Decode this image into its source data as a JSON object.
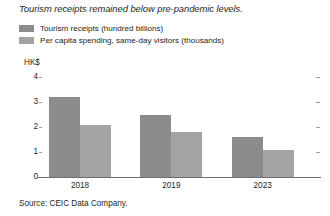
{
  "chart_data": {
    "type": "bar",
    "title": "Tourism receipts remained below pre-pandemic levels.",
    "xlabel": "",
    "ylabel": "HK$",
    "categories": [
      "2018",
      "2019",
      "2023"
    ],
    "series": [
      {
        "name": "Tourism receipts (hundred billions)",
        "color": "#8b8b8b",
        "values": [
          3.2,
          2.5,
          1.6
        ]
      },
      {
        "name": "Per capita spending, same-day visitors (thousands)",
        "color": "#a3a3a3",
        "values": [
          2.1,
          1.8,
          1.1
        ]
      }
    ],
    "ylim": [
      0,
      4
    ],
    "yticks": [
      0,
      1,
      2,
      3,
      4
    ],
    "ytick_labels": [
      "0",
      "1",
      "2",
      "3",
      "4"
    ],
    "grid": false,
    "legend_position": "top-left",
    "source": "Source: CEIC Data Company."
  },
  "axis": {
    "unit_label": "HK$"
  }
}
